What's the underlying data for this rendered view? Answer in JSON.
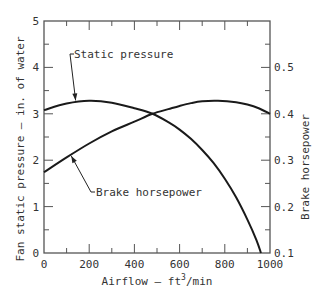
{
  "chart_data": {
    "type": "line",
    "title": "",
    "xlabel": "Airflow — ft³/min",
    "xlabel_parts": {
      "base": "Airflow — ft",
      "sup": "3",
      "tail": "/min"
    },
    "ylabel": "Fan static pressure — in. of water",
    "y2label": "Brake horsepower",
    "xlim": [
      0,
      1000
    ],
    "ylim": [
      0,
      5
    ],
    "y2lim": [
      0.1,
      0.5
    ],
    "y2lim_axis": [
      0.1,
      0.6
    ],
    "grid": false,
    "x_ticks_major": [
      0,
      200,
      400,
      600,
      800,
      1000
    ],
    "x_tick_labels": [
      "0",
      "200",
      "400",
      "600",
      "800",
      "1000"
    ],
    "x_ticks_minor": [
      100,
      300,
      500,
      700,
      900
    ],
    "y_ticks_major": [
      0,
      1,
      2,
      3,
      4,
      5
    ],
    "y_tick_labels": [
      "0",
      "1",
      "2",
      "3",
      "4",
      "5"
    ],
    "y_ticks_minor": [
      0.5,
      1.5,
      2.5,
      3.5,
      4.5
    ],
    "y2_ticks_major": [
      0.1,
      0.2,
      0.3,
      0.4,
      0.5
    ],
    "y2_tick_labels": [
      "0.1",
      "0.2",
      "0.3",
      "0.4",
      "0.5"
    ],
    "y2_ticks_minor": [
      0.15,
      0.25,
      0.35,
      0.45,
      0.55
    ],
    "series": [
      {
        "name": "Static pressure",
        "axis": "left",
        "x": [
          0,
          100,
          200,
          300,
          400,
          480,
          550,
          600,
          650,
          700,
          750,
          800,
          850,
          900,
          940,
          960
        ],
        "values": [
          3.08,
          3.22,
          3.28,
          3.24,
          3.12,
          3.0,
          2.82,
          2.66,
          2.46,
          2.22,
          1.94,
          1.6,
          1.2,
          0.72,
          0.28,
          0.0
        ]
      },
      {
        "name": "Brake horsepower",
        "axis": "right",
        "x": [
          0,
          100,
          200,
          300,
          400,
          480,
          550,
          600,
          650,
          700,
          770,
          850,
          900,
          950,
          1000
        ],
        "values": [
          0.274,
          0.306,
          0.336,
          0.362,
          0.383,
          0.4,
          0.41,
          0.417,
          0.423,
          0.427,
          0.428,
          0.425,
          0.42,
          0.412,
          0.4
        ]
      }
    ],
    "annotations": [
      {
        "text": "Static pressure",
        "target_series": "Static pressure",
        "target_x": 140
      },
      {
        "text": "Brake horsepower",
        "target_series": "Brake horsepower",
        "target_x": 125
      }
    ]
  }
}
